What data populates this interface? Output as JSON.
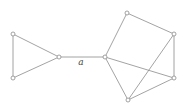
{
  "diagram": {
    "type": "graph",
    "nodes": [
      {
        "id": "L1",
        "x": 13,
        "y": 34
      },
      {
        "id": "L2",
        "x": 13,
        "y": 78
      },
      {
        "id": "L3",
        "x": 59,
        "y": 57
      },
      {
        "id": "C",
        "x": 105,
        "y": 57
      },
      {
        "id": "T",
        "x": 127,
        "y": 13
      },
      {
        "id": "UR",
        "x": 174,
        "y": 34
      },
      {
        "id": "LR",
        "x": 174,
        "y": 78
      },
      {
        "id": "B",
        "x": 128,
        "y": 100
      }
    ],
    "edges": [
      [
        "L1",
        "L2"
      ],
      [
        "L1",
        "L3"
      ],
      [
        "L2",
        "L3"
      ],
      [
        "L3",
        "C"
      ],
      [
        "C",
        "T"
      ],
      [
        "T",
        "UR"
      ],
      [
        "UR",
        "LR"
      ],
      [
        "UR",
        "B"
      ],
      [
        "C",
        "LR"
      ],
      [
        "C",
        "B"
      ],
      [
        "B",
        "LR"
      ]
    ],
    "edge_label": {
      "text": "a",
      "x": 81,
      "y": 65
    },
    "colors": {
      "stroke": "#8c8c8c",
      "background": "#ffffff"
    }
  }
}
